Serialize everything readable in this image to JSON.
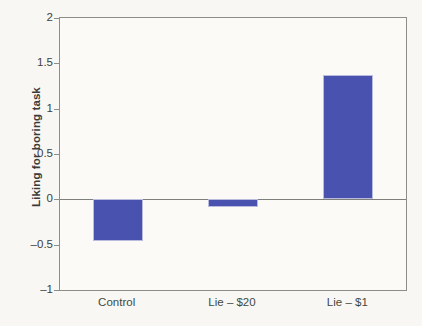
{
  "chart_data": {
    "type": "bar",
    "title": "",
    "subtitle": "",
    "xlabel": "",
    "ylabel": "Liking for boring task",
    "categories": [
      "Control",
      "Lie – $20",
      "Lie – $1"
    ],
    "values": [
      -0.46,
      -0.09,
      1.37
    ],
    "series": [
      {
        "name": "Liking for boring task",
        "values": [
          -0.46,
          -0.09,
          1.37
        ],
        "color": "#4a52b0"
      }
    ],
    "ylim": [
      -1,
      2
    ],
    "yticks": [
      2,
      1.5,
      1,
      0.5,
      0,
      -0.5,
      -1
    ],
    "ytick_labels": [
      "2",
      "1.5",
      "1",
      "0.5",
      "0",
      "–0.5",
      "–1"
    ],
    "grid": false,
    "legend": null,
    "legend_position": "none",
    "annotations": [],
    "zero_line": 0,
    "bar_color": "#4a52b0",
    "bar_edge_color": "#b9bcdd",
    "axis_color": "#8d8d8a",
    "background_color": "#f8f7f3",
    "plot_background_color": "#fbfaf7"
  }
}
